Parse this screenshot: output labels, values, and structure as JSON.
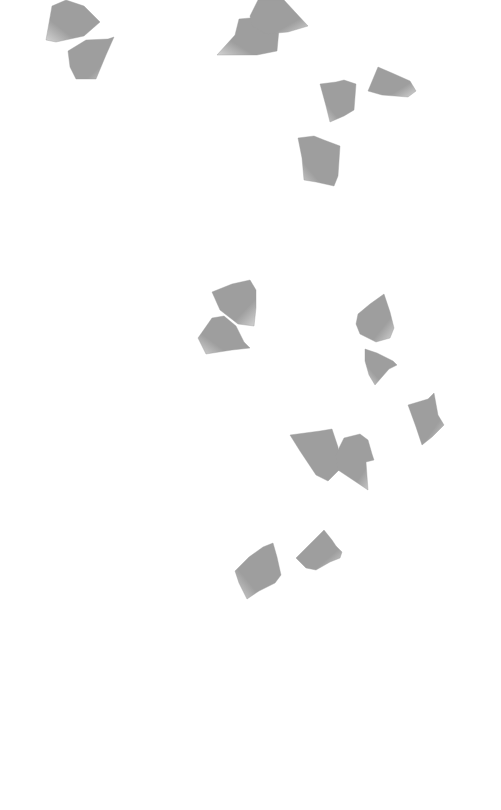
{
  "scene": {
    "background": "#ffffff",
    "description": "Grayscale petals scattered on white background",
    "petal_color": "#9e9e9e",
    "petal_highlight": "#d4d4d4",
    "petals": [
      {
        "x": 44,
        "y": 0,
        "w": 56,
        "h": 43,
        "points": "2,40 8,6 22,0 40,6 56,22 40,36 12,42"
      },
      {
        "x": 66,
        "y": 37,
        "w": 48,
        "h": 43,
        "points": "2,14 20,3 42,2 48,0 40,18 30,42 10,42 4,30"
      },
      {
        "x": 217,
        "y": 17,
        "w": 62,
        "h": 40,
        "points": "0,38 18,18 22,2 44,0 62,12 60,34 40,38"
      },
      {
        "x": 246,
        "y": 0,
        "w": 62,
        "h": 35,
        "points": "4,16 12,0 38,0 62,26 42,32 20,34 6,26"
      },
      {
        "x": 320,
        "y": 80,
        "w": 37,
        "h": 43,
        "points": "0,4 16,2 24,0 36,4 34,30 24,36 10,42 6,26"
      },
      {
        "x": 368,
        "y": 67,
        "w": 48,
        "h": 30,
        "points": "10,0 24,6 42,14 48,24 40,30 14,28 0,24"
      },
      {
        "x": 298,
        "y": 136,
        "w": 44,
        "h": 52,
        "points": "0,2 16,0 26,4 42,10 40,40 36,50 18,46 6,44 4,22"
      },
      {
        "x": 212,
        "y": 280,
        "w": 46,
        "h": 46,
        "points": "0,12 20,4 38,0 44,10 44,28 42,46 26,44 8,30"
      },
      {
        "x": 196,
        "y": 316,
        "w": 54,
        "h": 38,
        "points": "2,22 16,2 28,0 40,10 48,26 54,32 36,34 10,38"
      },
      {
        "x": 356,
        "y": 294,
        "w": 40,
        "h": 50,
        "points": "2,20 14,10 28,0 34,18 38,34 34,44 20,48 4,40 0,30"
      },
      {
        "x": 363,
        "y": 349,
        "w": 35,
        "h": 38,
        "points": "2,0 14,4 30,12 34,16 26,20 12,36 6,26 2,12"
      },
      {
        "x": 408,
        "y": 393,
        "w": 36,
        "h": 54,
        "points": "0,12 20,6 26,0 30,22 36,32 24,44 14,52 8,34"
      },
      {
        "x": 290,
        "y": 429,
        "w": 54,
        "h": 52,
        "points": "0,6 30,2 42,0 48,18 50,40 38,52 26,46 10,22"
      },
      {
        "x": 336,
        "y": 434,
        "w": 38,
        "h": 56,
        "points": "0,20 8,4 24,0 32,6 36,20 38,26 30,28 32,56 14,44 2,36"
      },
      {
        "x": 235,
        "y": 543,
        "w": 48,
        "h": 56,
        "points": "0,28 14,14 28,4 38,0 42,14 46,32 40,40 24,48 12,56 4,40"
      },
      {
        "x": 296,
        "y": 530,
        "w": 48,
        "h": 42,
        "points": "0,28 16,12 28,0 36,10 40,16 46,22 44,28 34,32 20,40 10,38"
      }
    ]
  }
}
